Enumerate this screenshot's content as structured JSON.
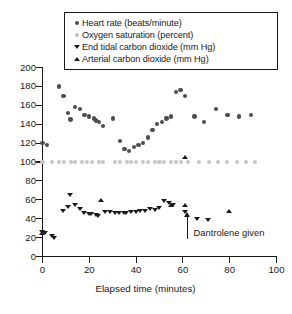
{
  "chart_data": {
    "type": "scatter",
    "title": "",
    "xlabel": "Elapsed time (minutes)",
    "ylabel": "",
    "xlim": [
      0,
      100
    ],
    "ylim": [
      0,
      200
    ],
    "xticks": [
      0,
      20,
      40,
      60,
      80,
      100
    ],
    "yticks": [
      0,
      20,
      40,
      60,
      80,
      100,
      120,
      140,
      160,
      180,
      200
    ],
    "grid": false,
    "legend_position": "top",
    "series": [
      {
        "name": "Heart rate (beats/minute)",
        "marker": "circle",
        "color": "#4d4d4d",
        "points": [
          [
            0,
            120
          ],
          [
            2,
            118
          ],
          [
            7,
            180
          ],
          [
            9,
            170
          ],
          [
            11,
            152
          ],
          [
            12,
            145
          ],
          [
            14,
            158
          ],
          [
            16,
            156
          ],
          [
            18,
            150
          ],
          [
            20,
            148
          ],
          [
            22,
            146
          ],
          [
            23,
            144
          ],
          [
            24,
            142
          ],
          [
            26,
            138
          ],
          [
            30,
            146
          ],
          [
            33,
            122
          ],
          [
            35,
            114
          ],
          [
            37,
            112
          ],
          [
            39,
            116
          ],
          [
            41,
            118
          ],
          [
            43,
            120
          ],
          [
            45,
            126
          ],
          [
            47,
            134
          ],
          [
            49,
            140
          ],
          [
            51,
            142
          ],
          [
            53,
            146
          ],
          [
            55,
            148
          ],
          [
            57,
            174
          ],
          [
            59,
            176
          ],
          [
            61,
            170
          ],
          [
            65,
            148
          ],
          [
            69,
            142
          ],
          [
            74,
            156
          ],
          [
            79,
            150
          ],
          [
            84,
            148
          ],
          [
            89,
            150
          ]
        ]
      },
      {
        "name": "Oxygen saturation (percent)",
        "marker": "circle",
        "color": "#c6c6c6",
        "points": [
          [
            0,
            100
          ],
          [
            4,
            100
          ],
          [
            7,
            100
          ],
          [
            9,
            100
          ],
          [
            12,
            100
          ],
          [
            14,
            100
          ],
          [
            17,
            100
          ],
          [
            19,
            100
          ],
          [
            21,
            100
          ],
          [
            24,
            100
          ],
          [
            26,
            100
          ],
          [
            31,
            100
          ],
          [
            33,
            100
          ],
          [
            36,
            100
          ],
          [
            38,
            100
          ],
          [
            40,
            100
          ],
          [
            43,
            100
          ],
          [
            45,
            100
          ],
          [
            48,
            100
          ],
          [
            50,
            100
          ],
          [
            52,
            100
          ],
          [
            55,
            100
          ],
          [
            57,
            100
          ],
          [
            59,
            100
          ],
          [
            62,
            100
          ],
          [
            67,
            100
          ],
          [
            71,
            100
          ],
          [
            75,
            100
          ],
          [
            79,
            100
          ],
          [
            83,
            100
          ],
          [
            87,
            100
          ],
          [
            91,
            100
          ]
        ]
      },
      {
        "name": "End tidal carbon dioxide (mm Hg)",
        "marker": "triangle-down",
        "color": "#1a1a1a",
        "points": [
          [
            0,
            26
          ],
          [
            1,
            25
          ],
          [
            4,
            21
          ],
          [
            5,
            19
          ],
          [
            9,
            48
          ],
          [
            11,
            52
          ],
          [
            12,
            65
          ],
          [
            14,
            54
          ],
          [
            16,
            50
          ],
          [
            18,
            46
          ],
          [
            20,
            45
          ],
          [
            21,
            45
          ],
          [
            23,
            44
          ],
          [
            24,
            43
          ],
          [
            27,
            47
          ],
          [
            29,
            47
          ],
          [
            31,
            46
          ],
          [
            33,
            46
          ],
          [
            35,
            46
          ],
          [
            36,
            46
          ],
          [
            38,
            47
          ],
          [
            40,
            47
          ],
          [
            42,
            48
          ],
          [
            44,
            48
          ],
          [
            46,
            50
          ],
          [
            48,
            49
          ],
          [
            50,
            51
          ],
          [
            52,
            58
          ],
          [
            54,
            56
          ],
          [
            56,
            54
          ],
          [
            61,
            47
          ],
          [
            66,
            39
          ],
          [
            71,
            38
          ]
        ]
      },
      {
        "name": "Arterial carbon dioxide (mm Hg)",
        "marker": "triangle-up",
        "color": "#1a1a1a",
        "points": [
          [
            0,
            25
          ],
          [
            25,
            60
          ],
          [
            55,
            54
          ],
          [
            61,
            105
          ],
          [
            61,
            54
          ],
          [
            80,
            48
          ]
        ]
      }
    ],
    "annotations": [
      {
        "text": "Dantrolene given",
        "x": 62,
        "arrow": "up",
        "arrow_from_y": 18,
        "arrow_to_y": 42
      }
    ]
  },
  "legend": {
    "entries": [
      {
        "marker": "dot-dark",
        "label": "Heart rate (beats/minute)"
      },
      {
        "marker": "dot-light",
        "label": "Oxygen saturation (percent)"
      },
      {
        "marker": "tri-down",
        "label": "End tidal carbon dioxide (mm Hg)"
      },
      {
        "marker": "tri-up",
        "label": "Arterial carbon dioxide (mm Hg)"
      }
    ]
  },
  "axes": {
    "x_title": "Elapsed time (minutes)",
    "x_tick_labels": [
      "0",
      "20",
      "40",
      "60",
      "80",
      "100"
    ],
    "y_tick_labels": [
      "0",
      "20",
      "40",
      "60",
      "80",
      "100",
      "120",
      "140",
      "160",
      "180",
      "200"
    ]
  },
  "annotation": {
    "label": "Dantrolene given"
  },
  "colors": {
    "heart_rate": "#4d4d4d",
    "oxygen_saturation": "#c6c6c6",
    "co2": "#1a1a1a",
    "axis": "#1a1a1a",
    "background": "#ffffff"
  }
}
